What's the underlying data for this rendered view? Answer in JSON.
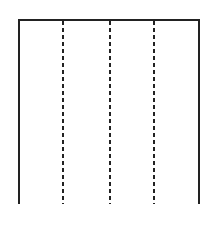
{
  "diagram": {
    "type": "rectangle-with-dashed-dividers",
    "frame": {
      "stroke": "#222222",
      "style": "solid"
    },
    "dividers": [
      {
        "x": 63,
        "style": "dashed"
      },
      {
        "x": 110,
        "style": "dashed"
      },
      {
        "x": 154,
        "style": "dashed"
      }
    ],
    "sections": 4
  }
}
